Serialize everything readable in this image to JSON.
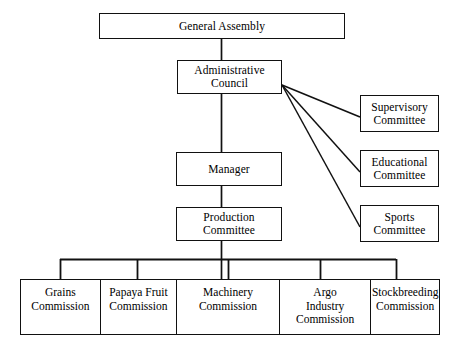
{
  "diagram": {
    "type": "organizational-chart",
    "orientation": "top-down",
    "line_color": "#111111",
    "box_fill": "#ffffff",
    "background": "#ffffff"
  },
  "nodes": {
    "general_assembly": {
      "label": "General Assembly"
    },
    "administrative_council": {
      "label": "Administrative\nCouncil"
    },
    "manager": {
      "label": "Manager"
    },
    "production_committee": {
      "label": "Production\nCommittee"
    },
    "supervisory_committee": {
      "label": "Supervisory\nCommittee"
    },
    "educational_committee": {
      "label": "Educational\nCommittee"
    },
    "sports_committee": {
      "label": "Sports\nCommittee"
    }
  },
  "commissions": [
    {
      "label": "Grains\nCommission"
    },
    {
      "label": "Papaya Fruit\nCommission"
    },
    {
      "label": "Machinery\nCommission"
    },
    {
      "label": "Argo\nIndustry\nCommission"
    },
    {
      "label": "Stockbreeding\nCommission"
    }
  ]
}
